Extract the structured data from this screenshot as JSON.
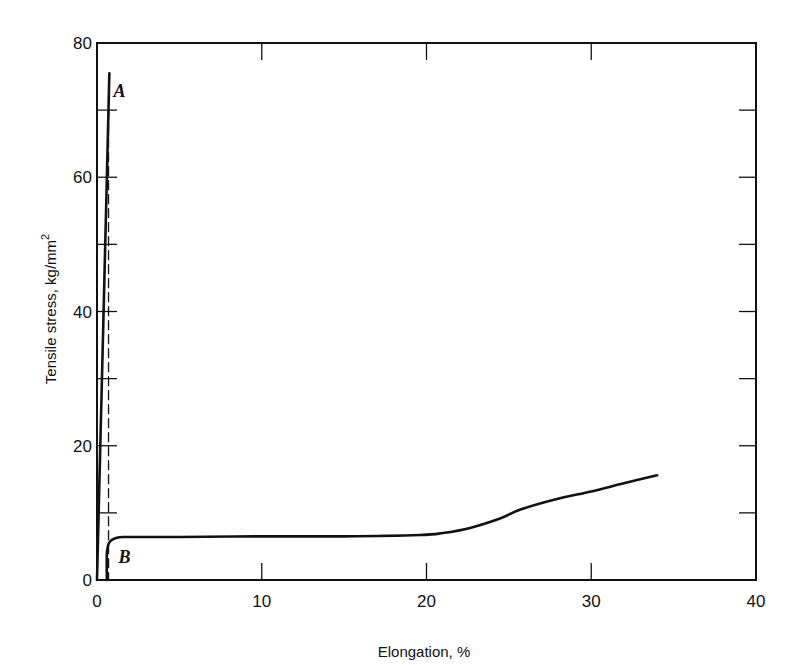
{
  "chart_data": {
    "type": "line",
    "title": "",
    "xlabel": "Elongation, %",
    "ylabel": "Tensile stress, kg/mm",
    "ylabel_superscript": "2",
    "xlim": [
      0,
      40
    ],
    "ylim": [
      0,
      80
    ],
    "x_ticks": [
      0,
      10,
      20,
      30,
      40
    ],
    "x_tick_labels": [
      "0",
      "10",
      "20",
      "30",
      "40"
    ],
    "y_ticks": [
      0,
      20,
      40,
      60,
      80
    ],
    "y_tick_labels": [
      "0",
      "20",
      "40",
      "60",
      "80"
    ],
    "y_minor_ticks": [
      10,
      30,
      50,
      70
    ],
    "grid": false,
    "legend": null,
    "series": [
      {
        "name": "A",
        "style": "solid",
        "points": [
          [
            0,
            0
          ],
          [
            0.2,
            20
          ],
          [
            0.4,
            40
          ],
          [
            0.6,
            60
          ],
          [
            0.75,
            75.5
          ]
        ]
      },
      {
        "name": "A unloading",
        "style": "dashed",
        "points": [
          [
            0.7,
            72
          ],
          [
            0.7,
            0
          ]
        ]
      },
      {
        "name": "B",
        "style": "solid",
        "points": [
          [
            0.6,
            0
          ],
          [
            0.6,
            4.0
          ],
          [
            0.75,
            5.6
          ],
          [
            1.2,
            6.3
          ],
          [
            2,
            6.4
          ],
          [
            5,
            6.4
          ],
          [
            10,
            6.5
          ],
          [
            15,
            6.5
          ],
          [
            19.6,
            6.7
          ],
          [
            21,
            7.0
          ],
          [
            22.7,
            7.8
          ],
          [
            24.5,
            9.2
          ],
          [
            25.7,
            10.5
          ],
          [
            27.8,
            12.0
          ],
          [
            30,
            13.2
          ],
          [
            31.8,
            14.3
          ],
          [
            34,
            15.6
          ]
        ]
      }
    ],
    "annotations": [
      {
        "text": "A",
        "x": 1.0,
        "y": 72
      },
      {
        "text": "B",
        "x": 1.3,
        "y": 2.5
      }
    ]
  }
}
